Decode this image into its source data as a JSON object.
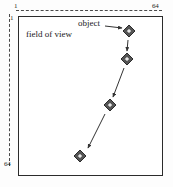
{
  "figure": {
    "background_color": "#ffffff",
    "frame_color": "#2b2b2b",
    "marker_color": "#555555",
    "arrow_color": "#333333"
  },
  "axes": {
    "horizontal": {
      "min_label": "1",
      "max_label": "64",
      "style": "dashed",
      "position": "top"
    },
    "vertical": {
      "min_label": "1",
      "max_label": "64",
      "style": "dashed",
      "position": "left"
    }
  },
  "labels": {
    "field_of_view": "field of view",
    "object": "object"
  },
  "chart_data": {
    "type": "scatter",
    "title": "field of view",
    "xlabel": "",
    "ylabel": "",
    "xlim": [
      1,
      64
    ],
    "ylim": [
      1,
      64
    ],
    "grid": false,
    "legend": null,
    "annotations": [
      {
        "text": "field of view",
        "x": 5,
        "y": 6
      },
      {
        "text": "object",
        "x": 31,
        "y": 2
      }
    ],
    "series": [
      {
        "name": "object trajectory",
        "marker": "diamond",
        "x": [
          55,
          54,
          45,
          28
        ],
        "y": [
          5,
          17,
          41,
          58
        ],
        "points": [
          {
            "index": 1,
            "x": 55,
            "y": 5,
            "px": 129,
            "py": 31
          },
          {
            "index": 2,
            "x": 54,
            "y": 17,
            "px": 127,
            "py": 59
          },
          {
            "index": 3,
            "x": 45,
            "y": 41,
            "px": 110,
            "py": 105
          },
          {
            "index": 4,
            "x": 28,
            "y": 58,
            "px": 80,
            "py": 156
          }
        ]
      }
    ],
    "motion_arrows": [
      {
        "from_point": 1,
        "to_point": 2,
        "x1": 128,
        "y1": 40,
        "x2": 127,
        "y2": 51
      },
      {
        "from_point": 2,
        "to_point": 3,
        "x1": 124,
        "y1": 68,
        "x2": 113,
        "y2": 97
      },
      {
        "from_point": 3,
        "to_point": 4,
        "x1": 105,
        "y1": 114,
        "x2": 88,
        "y2": 148
      }
    ],
    "pointer_arrow": {
      "label": "object",
      "x1": 105,
      "y1": 26,
      "x2": 122,
      "y2": 28
    }
  }
}
